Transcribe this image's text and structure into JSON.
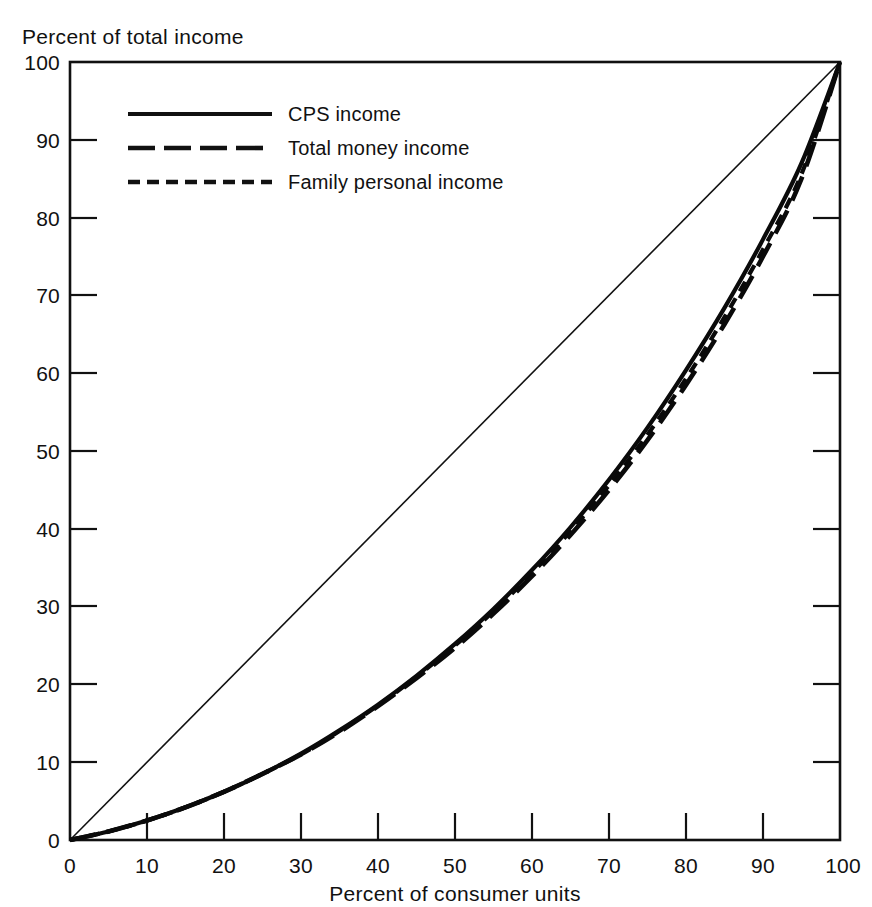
{
  "chart_data": {
    "type": "line",
    "title": "",
    "ylabel": "Percent of total income",
    "xlabel": "Percent of consumer units",
    "xlim": [
      0,
      100
    ],
    "ylim": [
      0,
      100
    ],
    "grid": false,
    "legend_position": "top-left inside plot",
    "x_ticks": [
      0,
      10,
      20,
      30,
      40,
      50,
      60,
      70,
      80,
      90,
      100
    ],
    "y_ticks": [
      0,
      10,
      20,
      30,
      40,
      50,
      60,
      70,
      80,
      90,
      100
    ],
    "x_tick_labels": [
      "0",
      "10",
      "20",
      "30",
      "40",
      "50",
      "60",
      "70",
      "80",
      "90",
      "100"
    ],
    "y_tick_labels": [
      "0",
      "10",
      "20",
      "30",
      "40",
      "50",
      "60",
      "70",
      "80",
      "90",
      "100"
    ],
    "reference_line": {
      "name": "line of equality",
      "style": "thin-solid",
      "x": [
        0,
        100
      ],
      "y": [
        0,
        100
      ]
    },
    "x": [
      0,
      5,
      10,
      15,
      20,
      25,
      30,
      35,
      40,
      45,
      50,
      55,
      60,
      65,
      70,
      75,
      80,
      85,
      90,
      95,
      100
    ],
    "series": [
      {
        "name": "CPS income",
        "style": "solid",
        "values": [
          0,
          1.1,
          2.5,
          4.2,
          6.2,
          8.5,
          11.1,
          14.1,
          17.4,
          21.1,
          25.2,
          29.7,
          34.7,
          40.2,
          46.3,
          53.0,
          60.4,
          68.4,
          77.2,
          87.0,
          100
        ]
      },
      {
        "name": "Total money income",
        "style": "long-dash",
        "values": [
          0,
          1.1,
          2.5,
          4.2,
          6.2,
          8.5,
          11.0,
          13.9,
          17.2,
          20.8,
          24.7,
          29.1,
          33.9,
          39.2,
          45.0,
          51.4,
          58.5,
          66.3,
          75.0,
          85.0,
          100
        ]
      },
      {
        "name": "Family personal income",
        "style": "short-dash",
        "values": [
          0,
          1.1,
          2.5,
          4.2,
          6.2,
          8.5,
          11.0,
          14.0,
          17.3,
          21.0,
          25.0,
          29.4,
          34.3,
          39.7,
          45.6,
          52.1,
          59.3,
          67.2,
          75.9,
          85.6,
          100
        ]
      }
    ]
  },
  "axes": {
    "y_axis_title": "Percent of total income",
    "x_axis_title": "Percent of consumer units"
  },
  "legend": {
    "items": [
      {
        "label": "CPS income",
        "style": "solid"
      },
      {
        "label": "Total money income",
        "style": "long-dash"
      },
      {
        "label": "Family personal income",
        "style": "short-dash"
      }
    ]
  },
  "ticks": {
    "y": [
      "100",
      "90",
      "80",
      "70",
      "60",
      "50",
      "40",
      "30",
      "20",
      "10",
      "0"
    ],
    "x": [
      "0",
      "10",
      "20",
      "30",
      "40",
      "50",
      "60",
      "70",
      "80",
      "90",
      "100"
    ]
  },
  "colors": {
    "ink": "#111111",
    "background": "#ffffff"
  }
}
